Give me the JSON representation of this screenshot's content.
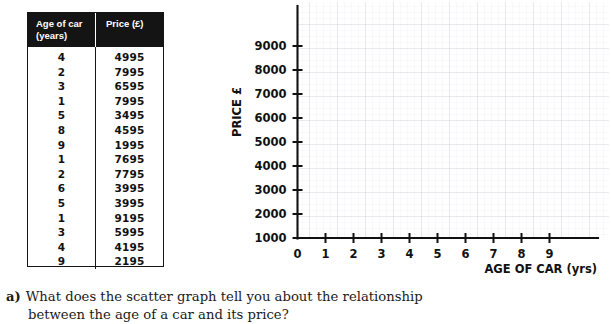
{
  "table": {
    "headers": [
      {
        "line1": "Age of car",
        "line2": "(years)"
      },
      {
        "line1": "Price (£)",
        "line2": ""
      }
    ],
    "rows": [
      {
        "age": "4",
        "price": "4995"
      },
      {
        "age": "2",
        "price": "7995"
      },
      {
        "age": "3",
        "price": "6595"
      },
      {
        "age": "1",
        "price": "7995"
      },
      {
        "age": "5",
        "price": "3495"
      },
      {
        "age": "8",
        "price": "4595"
      },
      {
        "age": "9",
        "price": "1995"
      },
      {
        "age": "1",
        "price": "7695"
      },
      {
        "age": "2",
        "price": "7795"
      },
      {
        "age": "6",
        "price": "3995"
      },
      {
        "age": "5",
        "price": "3995"
      },
      {
        "age": "1",
        "price": "9195"
      },
      {
        "age": "3",
        "price": "5995"
      },
      {
        "age": "4",
        "price": "4195"
      },
      {
        "age": "9",
        "price": "2195"
      }
    ]
  },
  "chart_data": {
    "type": "scatter",
    "title": "",
    "xlabel": "AGE OF CAR (yrs)",
    "ylabel": "PRICE £",
    "xticks": [
      "0",
      "1",
      "2",
      "3",
      "4",
      "5",
      "6",
      "7",
      "8",
      "9"
    ],
    "yticks": [
      "1000",
      "2000",
      "3000",
      "4000",
      "5000",
      "6000",
      "7000",
      "8000",
      "9000"
    ],
    "xlim": [
      0,
      10.75
    ],
    "ylim": [
      1000,
      9400
    ],
    "grid": true,
    "legend": null,
    "x": [],
    "y": [],
    "note": "blank grid – no points plotted"
  },
  "question": {
    "label": "a)",
    "line1": "What does the scatter graph tell you about the relationship",
    "line2": "between the age of a car and its price?"
  },
  "colors": {
    "header_bg": "#141414",
    "header_text": "#ffffff",
    "axis": "#111111",
    "grid_minor": "#eceaf0",
    "grid_major": "#d8d5de",
    "page_bg": "#ffffff",
    "body_text": "#111111"
  }
}
